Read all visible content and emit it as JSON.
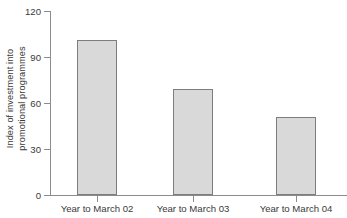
{
  "chart_data": {
    "type": "bar",
    "title": "",
    "xlabel": "",
    "ylabel": "Index of investment into promotional programmes",
    "ylabel_lines": [
      "Index of investment into",
      "promotional programmes"
    ],
    "categories": [
      "Year to March 02",
      "Year to March 03",
      "Year to March 04"
    ],
    "values": [
      101,
      69,
      51
    ],
    "ylim": [
      0,
      120
    ],
    "yticks": [
      0,
      30,
      60,
      90,
      120
    ],
    "ytick_labels": [
      "0",
      "30",
      "60",
      "90",
      "120"
    ],
    "grid": false,
    "legend": false,
    "legend_position": "none",
    "bar_fill_color": "#d9d9d9",
    "bar_border_color": "#7d7d7d",
    "axis_color": "#8c8c8c",
    "text_color": "#3a3a3a",
    "background_color": "#ffffff"
  }
}
